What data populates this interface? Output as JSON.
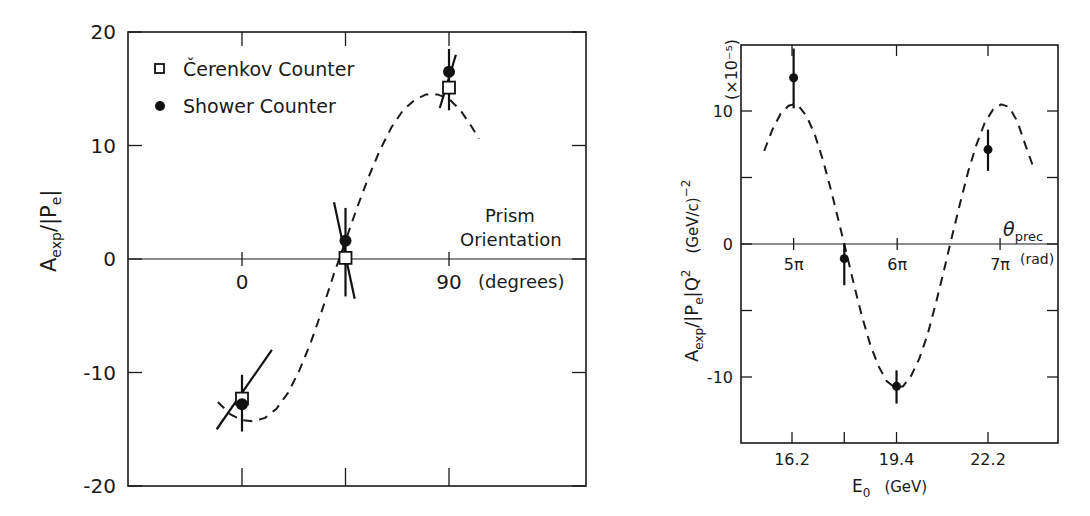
{
  "chart_data": [
    {
      "type": "scatter",
      "title": "",
      "xlabel": "Prism Orientation (degrees)",
      "xlabel_lines": [
        "Prism",
        "Orientation"
      ],
      "x_unit": "(degrees)",
      "ylabel": "A_exp/|P_e|",
      "ylabel_parts": {
        "main": "A",
        "sub": "exp",
        "mid": "/|P",
        "sub2": "e",
        "end": "|"
      },
      "xlim": [
        -45,
        135
      ],
      "ylim": [
        -20,
        20
      ],
      "x_ticks": [
        0,
        45,
        90
      ],
      "x_tick_labels": {
        "0": "0",
        "90": "90"
      },
      "y_ticks": [
        -20,
        -10,
        0,
        10,
        20
      ],
      "y_tick_labels": [
        "-20",
        "-10",
        "0",
        "10",
        "20"
      ],
      "grid": false,
      "zero_line": true,
      "legend": {
        "position": "upper-left",
        "entries": [
          {
            "marker": "open-square",
            "label": "Čerenkov Counter"
          },
          {
            "marker": "filled-circle",
            "label": "Shower Counter"
          }
        ]
      },
      "series": [
        {
          "name": "Čerenkov Counter",
          "marker": "open-square",
          "x": [
            0,
            45,
            90
          ],
          "y": [
            -12.3,
            0.1,
            15.1
          ]
        },
        {
          "name": "Shower Counter",
          "marker": "filled-circle",
          "x": [
            0,
            45,
            90
          ],
          "y": [
            -12.8,
            1.6,
            16.5
          ],
          "err_low": [
            -15.2,
            -3.3,
            13.1
          ],
          "err_high": [
            -10.2,
            4.5,
            18.5
          ]
        }
      ],
      "slanted_error_bars": [
        {
          "x1": -11,
          "y1": -15.0,
          "x2": 13,
          "y2": -8.0
        },
        {
          "x1": 40,
          "y1": 5.0,
          "x2": 49,
          "y2": -3.5
        },
        {
          "x1": 86,
          "y1": 13.3,
          "x2": 93,
          "y2": 18.0
        }
      ],
      "fit_curve": {
        "style": "dashed",
        "description": "sinusoidal fit",
        "points": [
          [
            -10.5,
            -12.6
          ],
          [
            -5,
            -13.7
          ],
          [
            0,
            -14.2
          ],
          [
            5,
            -14.3
          ],
          [
            10,
            -14.0
          ],
          [
            15,
            -13.2
          ],
          [
            20,
            -11.8
          ],
          [
            25,
            -9.8
          ],
          [
            30,
            -7.3
          ],
          [
            35,
            -4.4
          ],
          [
            40,
            -1.3
          ],
          [
            45,
            1.6
          ],
          [
            50,
            4.5
          ],
          [
            55,
            7.2
          ],
          [
            60,
            9.6
          ],
          [
            65,
            11.6
          ],
          [
            70,
            13.1
          ],
          [
            75,
            14.0
          ],
          [
            80,
            14.5
          ],
          [
            85,
            14.5
          ],
          [
            90,
            14.1
          ],
          [
            95,
            13.1
          ],
          [
            100,
            11.6
          ],
          [
            103,
            10.6
          ]
        ]
      }
    },
    {
      "type": "scatter",
      "title": "",
      "xlabel": "E_0 (GeV)",
      "xlabel_parts": {
        "main": "E",
        "sub": "0",
        "unit": "(GeV)"
      },
      "ylabel": "A_exp/|P_e|Q^2 (GeV/c)^-2",
      "ylabel_parts": {
        "main": "A",
        "sub": "exp",
        "mid": "/|P",
        "sub2": "e",
        "end": "|Q",
        "sup": "2",
        "unit": "(GeV/c)",
        "unit_sup": "−2"
      },
      "y_scale_label": "(×10⁻⁵)",
      "xlim": [
        14.7,
        23.3
      ],
      "ylim": [
        -15,
        15
      ],
      "x_ticks": [
        16.2,
        17.8,
        19.4,
        22.2
      ],
      "x_tick_labels": {
        "16.2": "16.2",
        "19.4": "19.4",
        "22.2": "22.2"
      },
      "y_ticks": [
        -10,
        -5,
        0,
        5,
        10
      ],
      "y_tick_labels": {
        "-10": "-10",
        "0": "0",
        "10": "10"
      },
      "secondary_x_axis": {
        "label": "θ_prec",
        "label_parts": {
          "main": "θ",
          "sub": "prec"
        },
        "unit": "(rad)",
        "ticks": [
          {
            "E": 16.25,
            "label": "5π"
          },
          {
            "E": 19.42,
            "label": "6π"
          },
          {
            "E": 22.57,
            "label": "7π"
          }
        ],
        "position": "on zero line"
      },
      "grid": false,
      "zero_line": true,
      "series": [
        {
          "name": "Data",
          "marker": "filled-circle",
          "x": [
            16.25,
            17.8,
            19.4,
            22.2
          ],
          "y": [
            12.5,
            -1.1,
            -10.7,
            7.1
          ],
          "err_low": [
            10.2,
            -3.1,
            -12.0,
            5.5
          ],
          "err_high": [
            14.7,
            0.0,
            -9.5,
            8.6
          ]
        }
      ],
      "fit_curve": {
        "style": "dashed",
        "description": "cosine of precession angle",
        "points": [
          [
            15.35,
            7.0
          ],
          [
            15.6,
            8.6
          ],
          [
            15.85,
            9.8
          ],
          [
            16.1,
            10.4
          ],
          [
            16.25,
            10.5
          ],
          [
            16.4,
            10.4
          ],
          [
            16.65,
            9.6
          ],
          [
            16.9,
            8.2
          ],
          [
            17.15,
            6.3
          ],
          [
            17.4,
            4.0
          ],
          [
            17.65,
            1.5
          ],
          [
            17.85,
            -0.5
          ],
          [
            18.1,
            -3.1
          ],
          [
            18.35,
            -5.5
          ],
          [
            18.6,
            -7.6
          ],
          [
            18.85,
            -9.2
          ],
          [
            19.1,
            -10.3
          ],
          [
            19.35,
            -10.8
          ],
          [
            19.6,
            -10.7
          ],
          [
            19.85,
            -9.9
          ],
          [
            20.1,
            -8.6
          ],
          [
            20.35,
            -6.8
          ],
          [
            20.6,
            -4.5
          ],
          [
            20.85,
            -2.0
          ],
          [
            21.1,
            0.6
          ],
          [
            21.35,
            3.1
          ],
          [
            21.6,
            5.5
          ],
          [
            21.85,
            7.5
          ],
          [
            22.1,
            9.1
          ],
          [
            22.35,
            10.1
          ],
          [
            22.6,
            10.5
          ],
          [
            22.85,
            10.3
          ],
          [
            23.1,
            9.2
          ],
          [
            23.35,
            7.4
          ],
          [
            23.6,
            5.7
          ]
        ]
      }
    }
  ]
}
